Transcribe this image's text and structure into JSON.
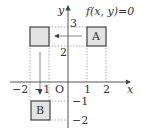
{
  "diagram": {
    "function_label": "f(x, y)=0",
    "axes": {
      "x_label": "x",
      "y_label": "y",
      "origin_label": "O"
    },
    "x_ticks": [
      "−2",
      "−1",
      "1",
      "2"
    ],
    "y_ticks": [
      "3",
      "2",
      "−1",
      "−2"
    ],
    "boxes": [
      {
        "id": "A",
        "label": "A",
        "x_range": [
          1,
          2
        ],
        "y_range": [
          2,
          3
        ]
      },
      {
        "id": "unlabeled",
        "label": "",
        "x_range": [
          -2,
          -1
        ],
        "y_range": [
          2,
          3
        ]
      },
      {
        "id": "B",
        "label": "B",
        "x_range": [
          -2,
          -1
        ],
        "y_range": [
          -2,
          -1
        ]
      }
    ],
    "colors": {
      "box_fill": "#e3e3e3",
      "line": "#444444",
      "dashed": "#888888"
    }
  }
}
